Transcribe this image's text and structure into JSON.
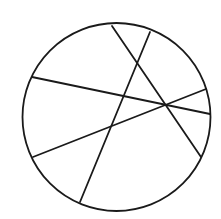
{
  "diagram": {
    "canvas": {
      "width": 221,
      "height": 219,
      "background": "#ffffff"
    },
    "stroke_color": "#1a1a1a",
    "stroke_width": 1.8,
    "circle": {
      "cx": 116.5,
      "cy": 117,
      "r": 94
    },
    "chords": [
      {
        "x1": 112,
        "y1": 26,
        "x2": 201,
        "y2": 157
      },
      {
        "x1": 150,
        "y1": 32,
        "x2": 80,
        "y2": 202
      },
      {
        "x1": 32,
        "y1": 77,
        "x2": 210,
        "y2": 114
      },
      {
        "x1": 33,
        "y1": 157,
        "x2": 206,
        "y2": 89
      }
    ]
  }
}
